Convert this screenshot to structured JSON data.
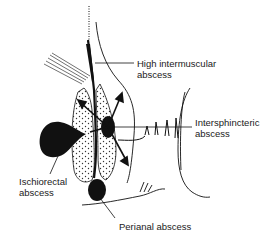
{
  "diagram": {
    "labels": {
      "high_intermuscular": [
        "High intermuscular",
        "abscess"
      ],
      "intersphincteric": [
        "Intersphincteric",
        "abscess"
      ],
      "ischiorectal": [
        "Ischiorectal",
        "abscess"
      ],
      "perianal": [
        "Perianal abscess"
      ]
    },
    "colors": {
      "ink": "#111111",
      "background": "#ffffff"
    }
  }
}
